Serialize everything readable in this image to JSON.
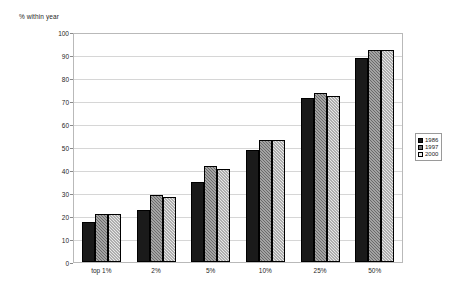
{
  "chart_data": {
    "type": "bar",
    "title": "",
    "subtitle": "",
    "xlabel": "",
    "ylabel": "% within year",
    "ylim": [
      0,
      100
    ],
    "ytick_step": 10,
    "yticks": [
      0,
      10,
      20,
      30,
      40,
      50,
      60,
      70,
      80,
      90,
      100
    ],
    "grid": true,
    "legend_position": "right",
    "categories": [
      "top 1%",
      "2%",
      "5%",
      "10%",
      "25%",
      "50%"
    ],
    "series": [
      {
        "name": "1986",
        "color": "#1a1a1a",
        "values": [
          17.5,
          23,
          35,
          49,
          72,
          89.5
        ]
      },
      {
        "name": "1997",
        "color": "#6b6b6b",
        "values": [
          21,
          29.5,
          42,
          53.5,
          74,
          93
        ]
      },
      {
        "name": "2000",
        "color": "#e8e8e8",
        "values": [
          21,
          28.5,
          41,
          53.5,
          73,
          93
        ]
      }
    ]
  },
  "axis": {
    "y_title": "% within year"
  },
  "legend": {
    "entries": [
      {
        "label": "1986"
      },
      {
        "label": "1997"
      },
      {
        "label": "2000"
      }
    ]
  }
}
